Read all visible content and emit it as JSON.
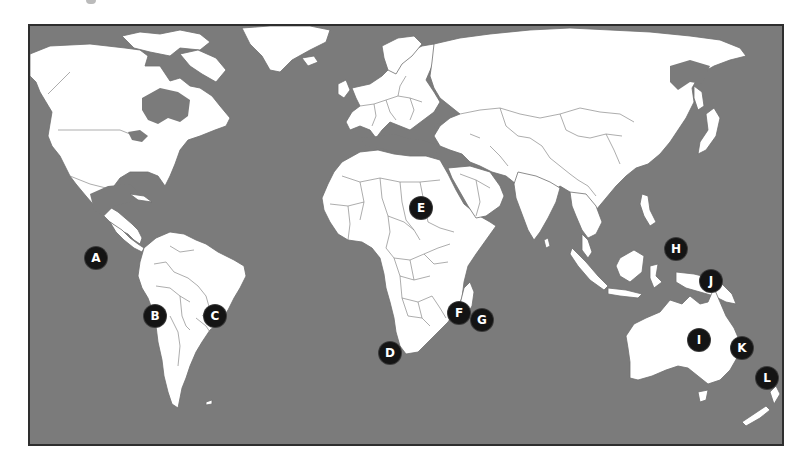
{
  "map": {
    "type": "world-outline-map",
    "ocean_color": "#7b7b7b",
    "land_color": "#ffffff",
    "frame_color": "#2e2e2e",
    "marker_color": "#141414",
    "marker_text_color": "#ffffff"
  },
  "markers": [
    {
      "label": "A",
      "x": 96,
      "y": 258,
      "region": "Pacific Ocean, west of Ecuador"
    },
    {
      "label": "B",
      "x": 155,
      "y": 316,
      "region": "Western South America (Chile/Bolivia)"
    },
    {
      "label": "C",
      "x": 215,
      "y": 316,
      "region": "Southeastern Brazil"
    },
    {
      "label": "D",
      "x": 390,
      "y": 353,
      "region": "Southern tip of Africa"
    },
    {
      "label": "E",
      "x": 421,
      "y": 208,
      "region": "Sudan / East Africa"
    },
    {
      "label": "F",
      "x": 459,
      "y": 313,
      "region": "Madagascar"
    },
    {
      "label": "G",
      "x": 482,
      "y": 320,
      "region": "Indian Ocean, east of Madagascar"
    },
    {
      "label": "H",
      "x": 676,
      "y": 249,
      "region": "Eastern Indonesia"
    },
    {
      "label": "I",
      "x": 699,
      "y": 340,
      "region": "Central Australia"
    },
    {
      "label": "J",
      "x": 711,
      "y": 281,
      "region": "New Guinea / Northern Australia"
    },
    {
      "label": "K",
      "x": 742,
      "y": 348,
      "region": "East of Australia"
    },
    {
      "label": "L",
      "x": 767,
      "y": 378,
      "region": "New Zealand"
    }
  ]
}
